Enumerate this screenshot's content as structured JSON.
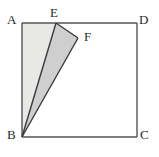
{
  "figure": {
    "type": "geometry-diagram",
    "background_color": "#ffffff",
    "stroke_color": "#555555",
    "stroke_width": 1.4,
    "label_color": "#2b2b2b",
    "vertices": [
      {
        "id": "A",
        "label": "A",
        "x": 22,
        "y": 23
      },
      {
        "id": "B",
        "label": "B",
        "x": 22,
        "y": 137
      },
      {
        "id": "C",
        "label": "C",
        "x": 137,
        "y": 137
      },
      {
        "id": "D",
        "label": "D",
        "x": 137,
        "y": 23
      },
      {
        "id": "E",
        "label": "E",
        "x": 56,
        "y": 23
      },
      {
        "id": "F",
        "label": "F",
        "x": 78,
        "y": 38
      }
    ],
    "square": {
      "name": "ABCD",
      "points": "22,23 137,23 137,137 22,137",
      "fill": "#ffffff"
    },
    "shaded_regions": [
      {
        "name": "triangle-ABE",
        "vertices": "A,B,E",
        "points": "22,23 22,137 56,23",
        "fill": "#e8e8e6",
        "shade": "light"
      },
      {
        "name": "triangle-BEF",
        "vertices": "B,E,F",
        "points": "22,137 56,23 78,38",
        "fill": "#cfcfcf",
        "shade": "dark"
      }
    ],
    "segments": [
      {
        "name": "segment-AB",
        "from": "A",
        "to": "B",
        "x1": 22,
        "y1": 23,
        "x2": 22,
        "y2": 137
      },
      {
        "name": "segment-AD",
        "from": "A",
        "to": "D",
        "x1": 22,
        "y1": 23,
        "x2": 137,
        "y2": 23
      },
      {
        "name": "segment-DC",
        "from": "D",
        "to": "C",
        "x1": 137,
        "y1": 23,
        "x2": 137,
        "y2": 137
      },
      {
        "name": "segment-BC",
        "from": "B",
        "to": "C",
        "x1": 22,
        "y1": 137,
        "x2": 137,
        "y2": 137
      },
      {
        "name": "segment-BE",
        "from": "B",
        "to": "E",
        "x1": 22,
        "y1": 137,
        "x2": 56,
        "y2": 23
      },
      {
        "name": "segment-EF",
        "from": "E",
        "to": "F",
        "x1": 56,
        "y1": 23,
        "x2": 78,
        "y2": 38
      },
      {
        "name": "segment-FB",
        "from": "F",
        "to": "B",
        "x1": 78,
        "y1": 38,
        "x2": 22,
        "y2": 137
      }
    ]
  }
}
